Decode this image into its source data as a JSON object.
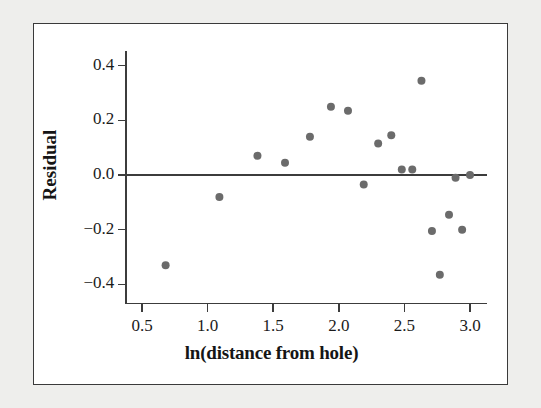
{
  "figure": {
    "background_color": "#eeeeec",
    "panel_color": "#ffffff",
    "frame_color": "#3a3a3a",
    "point_color": "#6b6b6b",
    "axis_color": "#3c3c3c"
  },
  "chart_data": {
    "type": "scatter",
    "title": "",
    "xlabel": "ln(distance from hole)",
    "ylabel": "Residual",
    "xlim": [
      0.38,
      3.13
    ],
    "ylim": [
      -0.47,
      0.47
    ],
    "grid": false,
    "legend": null,
    "reference_line": {
      "orientation": "horizontal",
      "y": 0.0
    },
    "xticks": [
      0.5,
      1.0,
      1.5,
      2.0,
      2.5,
      3.0
    ],
    "xtick_labels": [
      "0.5",
      "1.0",
      "1.5",
      "2.0",
      "2.5",
      "3.0"
    ],
    "yticks": [
      0.4,
      0.2,
      0.0,
      -0.2,
      -0.4
    ],
    "ytick_labels": [
      "0.4",
      "0.2",
      "0.0",
      "−0.2",
      "−0.4"
    ],
    "points": [
      {
        "x": 0.68,
        "y": -0.33
      },
      {
        "x": 1.09,
        "y": -0.08
      },
      {
        "x": 1.38,
        "y": 0.07
      },
      {
        "x": 1.59,
        "y": 0.045
      },
      {
        "x": 1.78,
        "y": 0.14
      },
      {
        "x": 1.94,
        "y": 0.25
      },
      {
        "x": 2.07,
        "y": 0.235
      },
      {
        "x": 2.19,
        "y": -0.035
      },
      {
        "x": 2.3,
        "y": 0.115
      },
      {
        "x": 2.4,
        "y": 0.145
      },
      {
        "x": 2.48,
        "y": 0.02
      },
      {
        "x": 2.56,
        "y": 0.02
      },
      {
        "x": 2.63,
        "y": 0.345
      },
      {
        "x": 2.71,
        "y": -0.205
      },
      {
        "x": 2.77,
        "y": -0.365
      },
      {
        "x": 2.84,
        "y": -0.145
      },
      {
        "x": 2.89,
        "y": -0.01
      },
      {
        "x": 2.94,
        "y": -0.2
      },
      {
        "x": 3.0,
        "y": 0.0
      }
    ]
  }
}
